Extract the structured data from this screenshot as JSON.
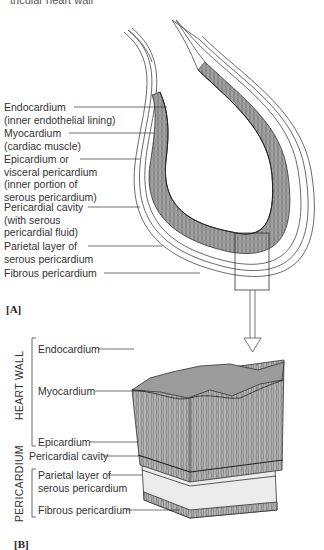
{
  "caption": "tricular heart wall",
  "panel_a": {
    "tag": "[A]",
    "labels": [
      {
        "line1": "Endocardium",
        "line2": "(inner endothelial lining)"
      },
      {
        "line1": "Myocardium",
        "line2": "(cardiac muscle)"
      },
      {
        "line1": "Epicardium or",
        "line2": "visceral pericardium",
        "line3": "(inner portion of",
        "line4": "serous pericardium)"
      },
      {
        "line1": "Pericardial cavity",
        "line2": "(with serous",
        "line3": "pericardial fluid)"
      },
      {
        "line1": "Parietal layer of",
        "line2": "serous pericardium"
      },
      {
        "line1": "Fibrous pericardium"
      }
    ]
  },
  "panel_b": {
    "tag": "[B]",
    "group_heart_wall": "HEART WALL",
    "group_pericardium": "PERICARDIUM",
    "labels": [
      {
        "line1": "Endocardium"
      },
      {
        "line1": "Myocardium"
      },
      {
        "line1": "Epicardium"
      },
      {
        "line1": "Pericardial cavity"
      },
      {
        "line1": "Parietal layer of",
        "line2": "serous pericardium"
      },
      {
        "line1": "Fibrous pericardium"
      }
    ]
  },
  "colors": {
    "muscle": "#9a9a9a",
    "line": "#333333",
    "layer_light": "#e6e6e6"
  }
}
